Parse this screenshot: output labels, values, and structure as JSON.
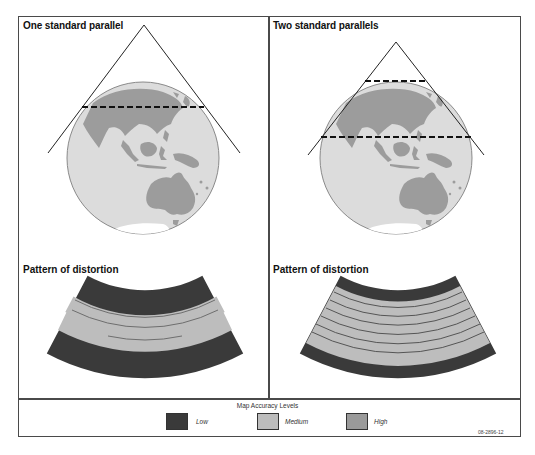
{
  "panels": [
    {
      "title": "One standard parallel",
      "distortion_title": "Pattern of distortion",
      "standard_parallels": 1
    },
    {
      "title": "Two standard parallels",
      "distortion_title": "Pattern of distortion",
      "standard_parallels": 2
    }
  ],
  "legend": {
    "title": "Map Accuracy Levels",
    "items": [
      {
        "label": "Low",
        "color": "#3a3a3a"
      },
      {
        "label": "Medium",
        "color": "#bdbdbd"
      },
      {
        "label": "High",
        "color": "#9a9a9a"
      }
    ]
  },
  "figure_id": "08-2896-12",
  "colors": {
    "ocean": "#dcdcdc",
    "land": "#9c9c9c",
    "outline": "#333333",
    "low": "#3a3a3a",
    "medium": "#bdbdbd",
    "line": "#6e6e6e"
  }
}
